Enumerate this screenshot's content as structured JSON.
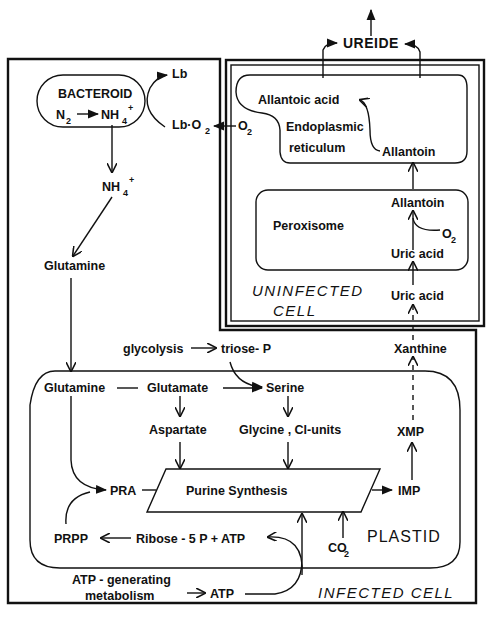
{
  "diagram": {
    "output": {
      "ureide": "UREIDE"
    },
    "infected_cell": {
      "label": "INFECTED CELL",
      "bacteroid": {
        "label": "BACTEROID",
        "n2": "N",
        "n2_sub": "2",
        "nh4": "NH",
        "nh4_sub": "4",
        "nh4_sup": "+"
      },
      "lb": "Lb",
      "lb_o2": "Lb·O",
      "lb_o2_sub": "2",
      "nh4_cyto": "NH",
      "nh4_cyto_sub": "4",
      "nh4_cyto_sup": "+",
      "glutamine_cyto": "Glutamine",
      "glycolysis": "glycolysis",
      "triose_p": "triose- P",
      "atp_gen_line1": "ATP - generating",
      "atp_gen_line2": "metabolism",
      "atp": "ATP",
      "xanthine": "Xanthine",
      "plastid": {
        "label": "PLASTID",
        "glutamine": "Glutamine",
        "glutamate": "Glutamate",
        "serine": "Serine",
        "aspartate": "Aspartate",
        "glycine": "Glycine , Cl-units",
        "pra": "PRA",
        "purine_synthesis": "Purine  Synthesis",
        "imp": "IMP",
        "xmp": "XMP",
        "prpp": "PRPP",
        "ribose": "Ribose - 5 P + ATP",
        "co2": "CO",
        "co2_sub": "2"
      }
    },
    "uninfected_cell": {
      "label_line1": "UNINFECTED",
      "label_line2": "CELL",
      "o2": "O",
      "o2_sub": "2",
      "er": {
        "allantoic_acid": "Allantoic  acid",
        "label_line1": "Endoplasmic",
        "label_line2": "reticulum",
        "allantoin": "Allantoin"
      },
      "peroxisome": {
        "label": "Peroxisome",
        "allantoin": "Allantoin",
        "o2": "O",
        "o2_sub": "2",
        "uric_acid": "Uric  acid"
      },
      "uric_acid_cyto": "Uric  acid"
    }
  }
}
